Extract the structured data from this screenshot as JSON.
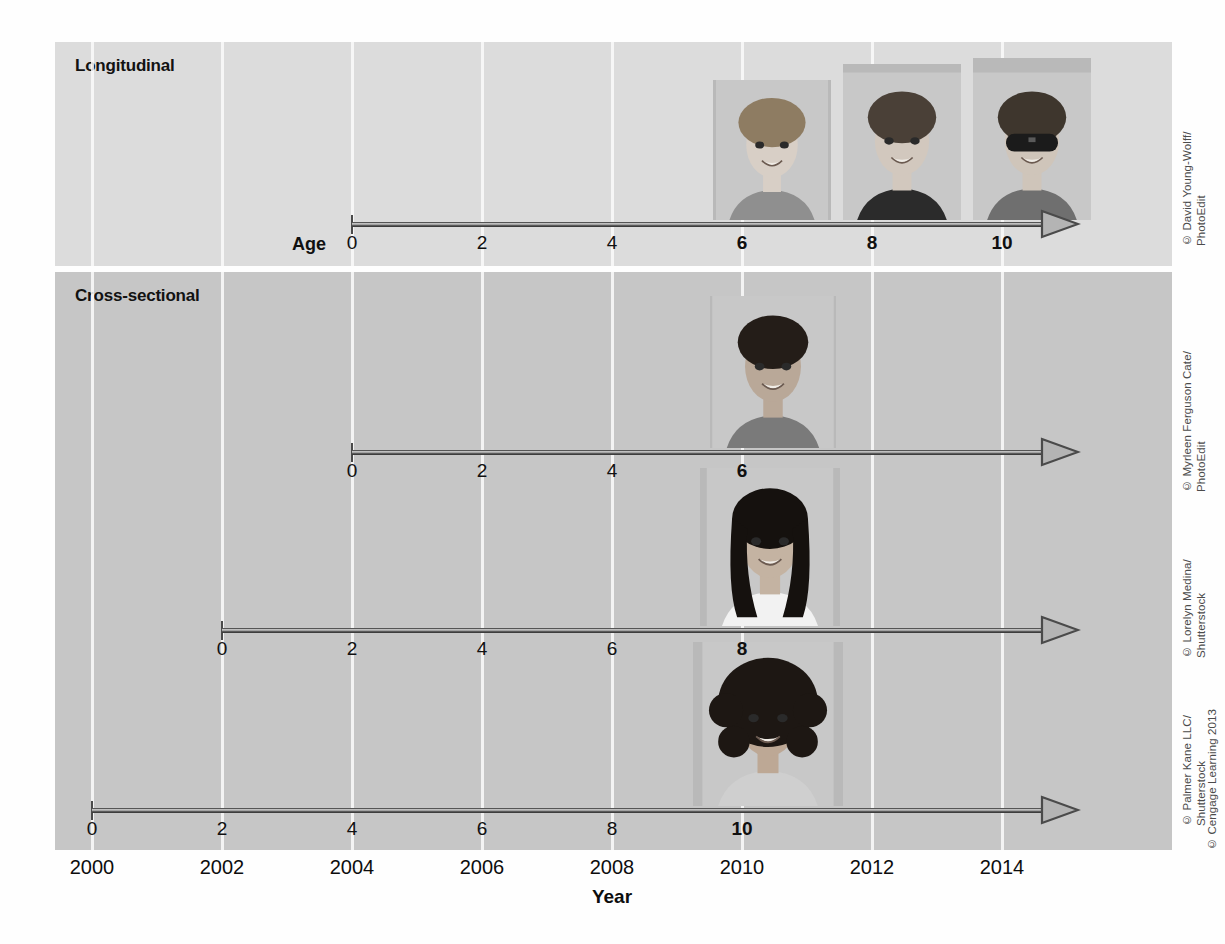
{
  "figure": {
    "year_axis_title": "Year",
    "age_caption": "Age"
  },
  "panels": [
    {
      "id": "longitudinal",
      "heading": "Longitudinal"
    },
    {
      "id": "cross-sectional",
      "heading": "Cross-sectional"
    }
  ],
  "chart_data": {
    "type": "timeline",
    "xlabel": "Year",
    "ylabel": "Age",
    "xlim": [
      2000,
      2015
    ],
    "grid": true,
    "legend": "none",
    "year_ticks": [
      "2000",
      "2002",
      "2004",
      "2006",
      "2008",
      "2010",
      "2012",
      "2014"
    ],
    "year_tick_values": [
      2000,
      2002,
      2004,
      2006,
      2008,
      2010,
      2012,
      2014
    ],
    "series": [
      {
        "name": "Longitudinal",
        "panel": "longitudinal",
        "start_year": 2004,
        "end_year": 2015,
        "age_ticks": [
          "0",
          "2",
          "4",
          "6",
          "8",
          "10"
        ],
        "age_tick_values": [
          0,
          2,
          4,
          6,
          8,
          10
        ],
        "bold_age_ticks": [
          "6",
          "8",
          "10"
        ],
        "observations": [
          {
            "age": 6,
            "year": 2010,
            "subject": "same-child"
          },
          {
            "age": 8,
            "year": 2012,
            "subject": "same-child"
          },
          {
            "age": 10,
            "year": 2014,
            "subject": "same-child"
          }
        ]
      },
      {
        "name": "Cross-sectional cohort born 2004",
        "panel": "cross-sectional",
        "start_year": 2004,
        "end_year": 2015,
        "age_ticks": [
          "0",
          "2",
          "4",
          "6"
        ],
        "age_tick_values": [
          0,
          2,
          4,
          6
        ],
        "bold_age_ticks": [
          "6"
        ],
        "observations": [
          {
            "age": 6,
            "year": 2010,
            "subject": "child-a"
          }
        ]
      },
      {
        "name": "Cross-sectional cohort born 2002",
        "panel": "cross-sectional",
        "start_year": 2002,
        "end_year": 2015,
        "age_ticks": [
          "0",
          "2",
          "4",
          "6",
          "8"
        ],
        "age_tick_values": [
          0,
          2,
          4,
          6,
          8
        ],
        "bold_age_ticks": [
          "8"
        ],
        "observations": [
          {
            "age": 8,
            "year": 2010,
            "subject": "child-b"
          }
        ]
      },
      {
        "name": "Cross-sectional cohort born 2000",
        "panel": "cross-sectional",
        "start_year": 2000,
        "end_year": 2015,
        "age_ticks": [
          "0",
          "2",
          "4",
          "6",
          "8",
          "10"
        ],
        "age_tick_values": [
          0,
          2,
          4,
          6,
          8,
          10
        ],
        "bold_age_ticks": [
          "10"
        ],
        "observations": [
          {
            "age": 10,
            "year": 2010,
            "subject": "child-c"
          }
        ]
      }
    ]
  },
  "credits": [
    {
      "id": "credit-longitudinal",
      "text": "© David Young-Wolff/\nPhotoEdit"
    },
    {
      "id": "credit-cross-1",
      "text": "© Myrleen Ferguson Cate/\nPhotoEdit"
    },
    {
      "id": "credit-cross-2",
      "text": "© Lorelyn Medina/\nShutterstock"
    },
    {
      "id": "credit-cross-3",
      "text": "© Palmer Kane LLC/\nShutterstock"
    },
    {
      "id": "credit-publisher",
      "text": "© Cengage Learning 2013"
    }
  ],
  "colors": {
    "panel_longitudinal": "#dcdcdc",
    "panel_cross_sectional": "#c6c6c6",
    "gridline": "#fafafa",
    "timeline": "#4a4a4a",
    "text": "#101010",
    "credit_text": "#4b4b4b",
    "page_background": "#fefefe"
  }
}
